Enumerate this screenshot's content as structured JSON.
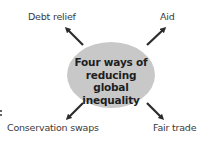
{
  "diagram": {
    "type": "mind-map",
    "center": {
      "lines": [
        "Four ways of",
        "reducing global",
        "inequality"
      ],
      "fill": "#c8c8c8"
    },
    "branches": [
      {
        "label": "Debt relief",
        "position": "top-left"
      },
      {
        "label": "Aid",
        "position": "top-right"
      },
      {
        "label": "Conservation swaps",
        "position": "bottom-left"
      },
      {
        "label": "Fair trade",
        "position": "bottom-right"
      }
    ],
    "arrow_color": "#2b2b2b"
  }
}
